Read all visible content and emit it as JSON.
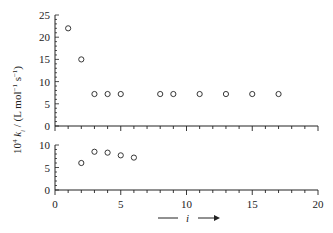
{
  "chart_data": [
    {
      "type": "scatter",
      "panel": "upper",
      "title": "",
      "xlabel": "i",
      "ylabel": "10^4 k_i / (L mol^-1 s^-1)",
      "xlim": [
        0,
        20
      ],
      "ylim": [
        0,
        25
      ],
      "yticks": [
        "0",
        "5",
        "10",
        "15",
        "20",
        "25"
      ],
      "grid": false,
      "marker": "open-circle",
      "x": [
        1,
        2,
        3,
        4,
        5,
        8,
        9,
        11,
        13,
        15,
        17
      ],
      "y": [
        22,
        15,
        7.2,
        7.2,
        7.2,
        7.2,
        7.2,
        7.2,
        7.2,
        7.2,
        7.2
      ]
    },
    {
      "type": "scatter",
      "panel": "lower",
      "title": "",
      "xlabel": "i",
      "ylabel": "10^4 k_i / (L mol^-1 s^-1)",
      "xlim": [
        0,
        20
      ],
      "ylim": [
        0,
        10
      ],
      "yticks": [
        "0",
        "5",
        "10"
      ],
      "xticks": [
        "0",
        "5",
        "10",
        "15",
        "20"
      ],
      "grid": false,
      "marker": "open-circle",
      "x": [
        2,
        3,
        4,
        5,
        6
      ],
      "y": [
        6,
        8.5,
        8.3,
        7.7,
        7.2
      ]
    }
  ],
  "labels": {
    "ylabel_prefix": "10",
    "ylabel_exp": "4",
    "ylabel_k": "k",
    "ylabel_sub": "i",
    "ylabel_units": " / (L mol",
    "ylabel_exp1": "−1",
    "ylabel_s": " s",
    "ylabel_exp2": "−1",
    "ylabel_close": ")",
    "xlabel": "i"
  }
}
